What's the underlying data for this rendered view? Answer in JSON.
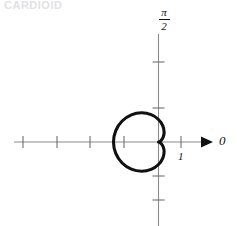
{
  "header": {
    "cutoff_text": "CARDIOID"
  },
  "figure": {
    "title": "",
    "polar_axis_label": "0",
    "vertical_axis_label_numerator": "π",
    "vertical_axis_label_denominator": "2",
    "unit_tick_label": "1",
    "colors": {
      "curve": "#111111",
      "axis": "#8a8a8a",
      "text": "#111111",
      "background": "#ffffff"
    }
  },
  "chart_data": {
    "type": "line",
    "plot_kind": "polar-curve",
    "title": "",
    "subtitle": "",
    "curve_name": "cardioid",
    "equation": "r = 1 - cos(theta)",
    "xlabel": "0",
    "ylabel": "π/2",
    "grid": false,
    "legend": null,
    "axes": {
      "polar_axis_direction": "right",
      "polar_axis_label": "0",
      "vertical_axis_label": "π/2",
      "xlim": [
        -2.6,
        1.6
      ],
      "ylim": [
        -1.85,
        1.85
      ],
      "x_ticks": [
        -2,
        -1.5,
        -1,
        -0.5,
        1
      ],
      "x_tick_labels": [
        "",
        "",
        "",
        "",
        "1"
      ],
      "y_ticks": [
        -1,
        1
      ],
      "y_tick_labels": [
        "",
        ""
      ],
      "arrow_on_x_axis": true,
      "unit_tick_value": 1
    },
    "r_max": 2,
    "cusp_at_origin": true,
    "opens_toward": "left",
    "theta_range_deg": [
      0,
      360
    ],
    "points_polar": [
      {
        "theta_deg": 0,
        "r": 0.0
      },
      {
        "theta_deg": 15,
        "r": 0.034
      },
      {
        "theta_deg": 30,
        "r": 0.134
      },
      {
        "theta_deg": 45,
        "r": 0.293
      },
      {
        "theta_deg": 60,
        "r": 0.5
      },
      {
        "theta_deg": 75,
        "r": 0.741
      },
      {
        "theta_deg": 90,
        "r": 1.0
      },
      {
        "theta_deg": 105,
        "r": 1.259
      },
      {
        "theta_deg": 120,
        "r": 1.5
      },
      {
        "theta_deg": 135,
        "r": 1.707
      },
      {
        "theta_deg": 150,
        "r": 1.866
      },
      {
        "theta_deg": 165,
        "r": 1.966
      },
      {
        "theta_deg": 180,
        "r": 2.0
      },
      {
        "theta_deg": 195,
        "r": 1.966
      },
      {
        "theta_deg": 210,
        "r": 1.866
      },
      {
        "theta_deg": 225,
        "r": 1.707
      },
      {
        "theta_deg": 240,
        "r": 1.5
      },
      {
        "theta_deg": 255,
        "r": 1.259
      },
      {
        "theta_deg": 270,
        "r": 1.0
      },
      {
        "theta_deg": 285,
        "r": 0.741
      },
      {
        "theta_deg": 300,
        "r": 0.5
      },
      {
        "theta_deg": 315,
        "r": 0.293
      },
      {
        "theta_deg": 330,
        "r": 0.134
      },
      {
        "theta_deg": 345,
        "r": 0.034
      },
      {
        "theta_deg": 360,
        "r": 0.0
      }
    ]
  }
}
